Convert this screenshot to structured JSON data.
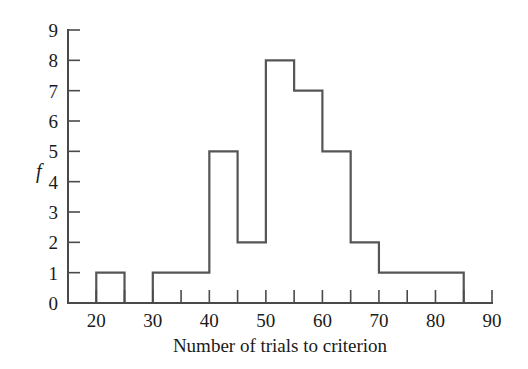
{
  "chart_data": {
    "type": "bar",
    "title": "",
    "xlabel": "Number of trials to criterion",
    "ylabel": "f",
    "categories": [
      "15-20",
      "20-25",
      "25-30",
      "30-35",
      "35-40",
      "40-45",
      "45-50",
      "50-55",
      "55-60",
      "60-65",
      "65-70",
      "70-75",
      "75-80",
      "80-85",
      "85-90"
    ],
    "bin_starts": [
      15,
      20,
      25,
      30,
      35,
      40,
      45,
      50,
      55,
      60,
      65,
      70,
      75,
      80,
      85
    ],
    "bin_width": 5,
    "values": [
      0,
      1,
      0,
      1,
      1,
      5,
      2,
      8,
      7,
      5,
      2,
      1,
      1,
      1,
      0
    ],
    "xlim": [
      15,
      90
    ],
    "ylim": [
      0,
      9
    ],
    "x_ticks": [
      15,
      20,
      25,
      30,
      35,
      40,
      45,
      50,
      55,
      60,
      65,
      70,
      75,
      80,
      85,
      90
    ],
    "x_tick_labels": [
      "",
      "20",
      "",
      "30",
      "",
      "40",
      "",
      "50",
      "",
      "60",
      "",
      "70",
      "",
      "80",
      "",
      "90"
    ],
    "y_ticks": [
      0,
      1,
      2,
      3,
      4,
      5,
      6,
      7,
      8,
      9
    ],
    "y_tick_labels": [
      "0",
      "1",
      "2",
      "3",
      "4",
      "5",
      "6",
      "7",
      "8",
      "9"
    ],
    "grid": false,
    "legend": false,
    "bar_style": "outline",
    "colors": {
      "bar_stroke": "#555555",
      "axis": "#4a4a4a",
      "text": "#1a1a1a",
      "background": "#ffffff"
    }
  },
  "axes": {
    "x_title": "Number of trials to criterion",
    "y_title": "f"
  }
}
